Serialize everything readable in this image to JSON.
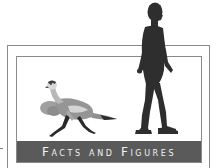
{
  "banner": {
    "title": "Facts and Figures"
  },
  "illustration": {
    "subjects": [
      "dinosaur",
      "human"
    ],
    "colors": {
      "frame": "#8a8a8a",
      "banner_bg": "#5a5a5a",
      "banner_text": "#f2f2f2",
      "human": "#2e2e2e",
      "dinosaur_body": "#8f8f8f",
      "dinosaur_light": "#cfcfcf",
      "dinosaur_dark": "#2a2a2a"
    }
  }
}
